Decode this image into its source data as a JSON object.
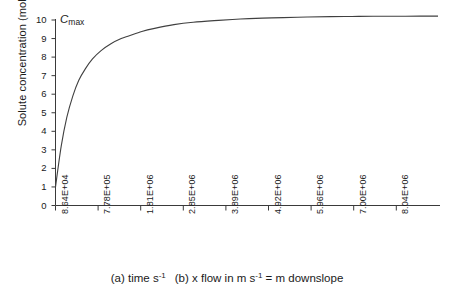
{
  "chart_data": {
    "type": "line",
    "title": "",
    "xlabel": "(a) time s-1   (b) x flow in m s-1 = m downslope",
    "ylabel": "Solute concentration (mol/l)",
    "ylim": [
      0,
      10.5
    ],
    "yticks": [
      "0",
      "1",
      "2",
      "3",
      "4",
      "5",
      "6",
      "7",
      "8",
      "9",
      "10"
    ],
    "xticks": [
      "8.64E+04",
      "7.78E+05",
      "1.81E+06",
      "2.85E+06",
      "3.89E+06",
      "4.92E+06",
      "5.96E+06",
      "7.00E+06",
      "8.04E+06"
    ],
    "grid": false,
    "legend": false,
    "annotations": [
      {
        "text": "Cmax",
        "value": 10.2,
        "position": "top-left"
      }
    ],
    "series": [
      {
        "name": "Solute concentration",
        "x": [
          86400,
          220000,
          350000,
          490000,
          630000,
          778000,
          950000,
          1150000,
          1380000,
          1620000,
          1810000,
          2100000,
          2400000,
          2850000,
          3300000,
          3890000,
          4400000,
          4920000,
          5400000,
          5960000,
          6500000,
          7000000,
          7500000,
          8040000,
          8600000
        ],
        "y": [
          1.0,
          3.2,
          4.75,
          5.9,
          6.75,
          7.35,
          7.9,
          8.35,
          8.72,
          9.0,
          9.15,
          9.38,
          9.55,
          9.75,
          9.88,
          9.98,
          10.05,
          10.1,
          10.13,
          10.16,
          10.18,
          10.19,
          10.2,
          10.2,
          10.21
        ],
        "color": "#404040"
      }
    ]
  },
  "axis": {
    "cmax_c": "C",
    "cmax_sub": "max"
  },
  "caption": {
    "part_a_pre": "(a) time s",
    "part_a_sup": "-1",
    "part_b_pre": "(b) x flow in m s",
    "part_b_sup": "-1",
    "part_b_post": " = m downslope"
  }
}
